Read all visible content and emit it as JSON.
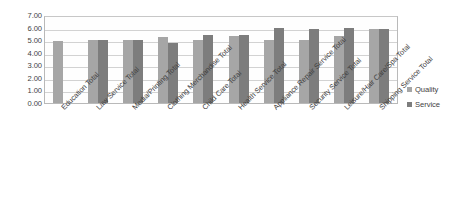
{
  "chart_data": {
    "type": "bar",
    "title": "",
    "subtitle": "",
    "xlabel": "",
    "ylabel": "",
    "ylim": [
      0.0,
      7.0
    ],
    "ytick_labels": [
      "7.00",
      "6.00",
      "5.00",
      "4.00",
      "3.00",
      "2.00",
      "1.00",
      "0.00"
    ],
    "ytick_values": [
      7.0,
      6.0,
      5.0,
      4.0,
      3.0,
      2.0,
      1.0,
      0.0
    ],
    "grid": true,
    "legend_position": "right",
    "categories": [
      "Education Total",
      "Law Service Total",
      "Media/Printing Total",
      "Clothing Merchandise Total",
      "Child Care Total",
      "Health Service Total",
      "Appliance Repair Service Total",
      "Security Service Total",
      "Leisure/Hair Care/Spa Total",
      "Shipping Service Total"
    ],
    "series": [
      {
        "name": "Quality",
        "color": "#a6a6a6",
        "values": [
          4.95,
          5.0,
          5.0,
          5.25,
          5.0,
          5.3,
          5.05,
          5.05,
          5.3,
          5.9
        ]
      },
      {
        "name": "Service",
        "color": "#7d7d7d",
        "values": [
          0.0,
          5.0,
          5.0,
          4.75,
          5.4,
          5.45,
          5.95,
          5.9,
          5.95,
          5.9
        ]
      }
    ]
  },
  "legend": {
    "items": [
      {
        "label": "Quality",
        "color": "#a6a6a6"
      },
      {
        "label": "Service",
        "color": "#7d7d7d"
      }
    ]
  }
}
